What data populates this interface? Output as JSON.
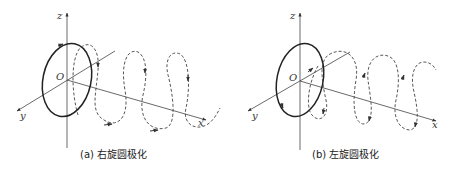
{
  "figure": {
    "panels": [
      {
        "id": "a",
        "caption": "(a) 右旋圆极化",
        "axes": {
          "z": "z",
          "y": "y",
          "x": "x",
          "origin": "O"
        },
        "polarization": "right-hand circular"
      },
      {
        "id": "b",
        "caption": "(b) 左旋圆极化",
        "axes": {
          "z": "z",
          "y": "y",
          "x": "x",
          "origin": "O"
        },
        "polarization": "left-hand circular"
      }
    ]
  },
  "colors": {
    "line": "#333333",
    "ellipse": "#222222",
    "helix": "#444444"
  }
}
